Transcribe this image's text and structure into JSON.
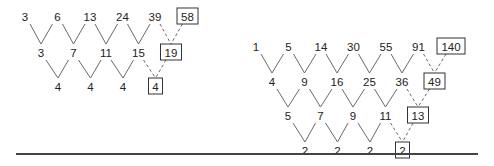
{
  "diagram": {
    "tables": [
      {
        "name": "left",
        "rows": [
          {
            "values": [
              "3",
              "6",
              "13",
              "24",
              "39"
            ],
            "predicted": "58",
            "y": 16,
            "x0": 25
          },
          {
            "values": [
              "3",
              "7",
              "11",
              "15"
            ],
            "predicted": "19",
            "y": 52,
            "x0": 41
          },
          {
            "values": [
              "4",
              "4",
              "4"
            ],
            "predicted": "4",
            "y": 86,
            "x0": 58
          }
        ],
        "step": 32.5
      },
      {
        "name": "right",
        "rows": [
          {
            "values": [
              "1",
              "5",
              "14",
              "30",
              "55",
              "91"
            ],
            "predicted": "140",
            "y": 46,
            "x0": 256
          },
          {
            "values": [
              "4",
              "9",
              "16",
              "25",
              "36"
            ],
            "predicted": "49",
            "y": 81,
            "x0": 272
          },
          {
            "values": [
              "5",
              "7",
              "9",
              "11"
            ],
            "predicted": "13",
            "y": 115,
            "x0": 288
          },
          {
            "values": [
              "2",
              "2",
              "2"
            ],
            "predicted": "2",
            "y": 150,
            "x0": 305
          }
        ],
        "step": 32.5
      }
    ],
    "baseline": {
      "x1": 16,
      "x2": 478,
      "y": 154
    },
    "colors": {
      "line": "#6a6a6a",
      "text": "#222222",
      "box": "#333333",
      "baseline": "#444444"
    }
  }
}
